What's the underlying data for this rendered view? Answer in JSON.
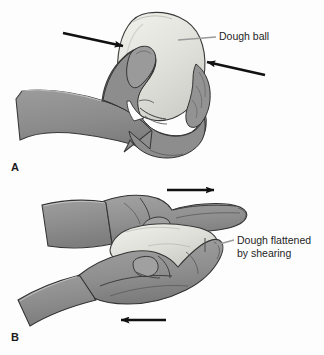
{
  "figure": {
    "name": "dough-ball-shearing-figure",
    "width": 324,
    "height": 355,
    "background_color": "#fdfdfd",
    "style": "grayscale line-art medical illustration"
  },
  "panels": [
    {
      "id": "A",
      "letter": "A",
      "description": "A hand squeezing a dough ball between thumb and fingers",
      "arrows": [
        {
          "name": "compression-arrow-left",
          "direction": "right",
          "label": ""
        },
        {
          "name": "compression-arrow-right",
          "direction": "left",
          "label": ""
        }
      ],
      "callout": {
        "name": "dough-ball-callout",
        "text": "Dough ball",
        "line1": "Dough ball",
        "line2": ""
      }
    },
    {
      "id": "B",
      "letter": "B",
      "description": "Two hands shearing a dough ball flat between palms moving in opposite directions",
      "arrows": [
        {
          "name": "shear-arrow-top",
          "direction": "right",
          "label": ""
        },
        {
          "name": "shear-arrow-bottom",
          "direction": "left",
          "label": ""
        }
      ],
      "callout": {
        "name": "dough-flattened-callout",
        "text": "Dough flattened by shearing",
        "line1": "Dough flattened",
        "line2": "by shearing"
      }
    }
  ],
  "colors": {
    "background": "#fdfdfd",
    "skin_mid": "#8e8e8e",
    "skin_light": "#a6a6a6",
    "skin_dark": "#7a7a7a",
    "skin_shadow": "#6d6d6d",
    "dough_light": "#e4e4de",
    "dough_mid": "#d5d5cf",
    "dough_shadow": "#c3c3bd",
    "outline": "#2b2b2b",
    "arrow": "#111111",
    "leader_line": "#9a9a9a",
    "text": "#1f1f1f"
  }
}
